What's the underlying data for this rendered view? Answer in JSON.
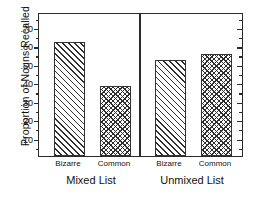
{
  "chart_data": {
    "type": "bar",
    "title": "",
    "subtitle": "",
    "xlabel": "",
    "ylabel": "Proportion of Nouns Recalled",
    "ylim": [
      0,
      0.78
    ],
    "ytick_labels": [
      ".10",
      ".20",
      ".30",
      ".40",
      ".50",
      ".60",
      ".70"
    ],
    "ytick_values": [
      0.1,
      0.2,
      0.3,
      0.4,
      0.5,
      0.6,
      0.7
    ],
    "minor_ticks": true,
    "grid": false,
    "legend": "none",
    "groups": [
      "Mixed List",
      "Unmixed List"
    ],
    "categories": [
      "Bizarre",
      "Common"
    ],
    "series": [
      {
        "name": "Bizarre",
        "pattern": "diagonal-hatch",
        "values": [
          0.62,
          0.52
        ]
      },
      {
        "name": "Common",
        "pattern": "cross-hatch",
        "values": [
          0.38,
          0.55
        ]
      }
    ],
    "bars": [
      {
        "group": "Mixed List",
        "category": "Bizarre",
        "value": 0.62,
        "pattern": "diagonal-hatch"
      },
      {
        "group": "Mixed List",
        "category": "Common",
        "value": 0.38,
        "pattern": "cross-hatch"
      },
      {
        "group": "Unmixed List",
        "category": "Bizarre",
        "value": 0.52,
        "pattern": "diagonal-hatch"
      },
      {
        "group": "Unmixed List",
        "category": "Common",
        "value": 0.55,
        "pattern": "cross-hatch"
      }
    ]
  },
  "axis": {
    "y_title": "Proportion of Nouns Recalled"
  },
  "labels": {
    "bar1_category": "Bizarre",
    "bar2_category": "Common",
    "bar3_category": "Bizarre",
    "bar4_category": "Common",
    "group1": "Mixed List",
    "group2": "Unmixed List"
  },
  "colors": {
    "frame": "#2a2a2a",
    "hatch": "#2e2e2e",
    "background": "#ffffff",
    "text": "#111111"
  }
}
